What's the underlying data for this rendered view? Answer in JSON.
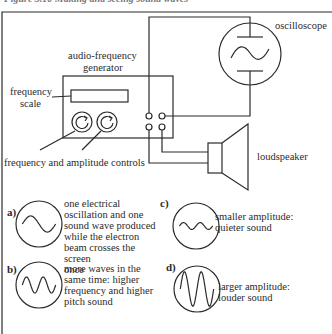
{
  "figure": {
    "caption": "Figure 3.10  Making and seeing sound waves",
    "components": {
      "oscilloscope": "oscilloscope",
      "generator_line1": "audio-frequency",
      "generator_line2": "generator",
      "frequency_scale_line1": "frequency",
      "frequency_scale_line2": "scale",
      "controls": "frequency and amplitude controls",
      "loudspeaker": "loudspeaker"
    },
    "panels": [
      {
        "letter": "a)",
        "lines": [
          "one electrical",
          "oscillation and one",
          "sound wave produced",
          "while the electron",
          "beam crosses the screen",
          "once"
        ],
        "wave": {
          "cycles": 1,
          "amplitude": 0.35
        }
      },
      {
        "letter": "b)",
        "lines": [
          "more waves in the",
          "same time: higher",
          "frequency and higher",
          "pitch sound"
        ],
        "wave": {
          "cycles": 2,
          "amplitude": 0.35
        }
      },
      {
        "letter": "c)",
        "lines": [
          "smaller amplitude:",
          "quieter sound"
        ],
        "wave": {
          "cycles": 2,
          "amplitude": 0.15
        }
      },
      {
        "letter": "d)",
        "lines": [
          "larger amplitude:",
          "louder sound"
        ],
        "wave": {
          "cycles": 2,
          "amplitude": 0.75
        }
      }
    ]
  }
}
